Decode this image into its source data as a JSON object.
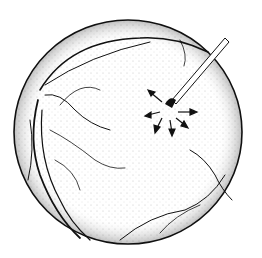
{
  "illustration": {
    "subject": "retina with laser probe treating a lesion",
    "colors": {
      "ink": "#111111",
      "background": "#ffffff"
    }
  }
}
